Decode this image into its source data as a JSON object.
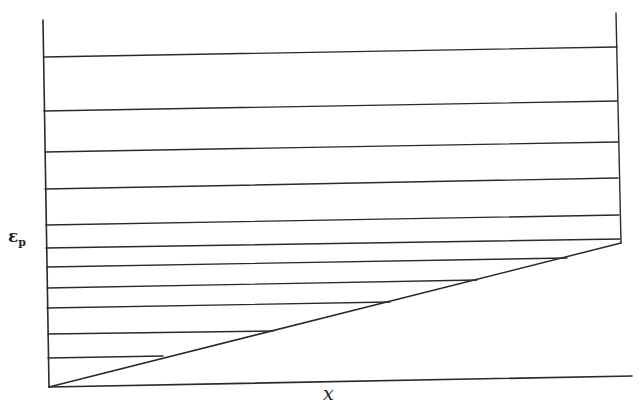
{
  "diagram": {
    "type": "line-diagram",
    "y_axis_label": "ε",
    "y_axis_label_subscript": "p",
    "x_axis_label": "x",
    "stroke_color": "#2a2a2a",
    "background": "#ffffff",
    "axes": {
      "left_axis": {
        "x1": 43,
        "y1": 20,
        "x2": 49,
        "y2": 387
      },
      "bottom_axis": {
        "x1": 49,
        "y1": 387,
        "x2": 632,
        "y2": 376
      },
      "right_boundary": {
        "x1": 616,
        "y1": 13,
        "x2": 621,
        "y2": 243
      },
      "diagonal": {
        "x1": 49,
        "y1": 387,
        "x2": 621,
        "y2": 243
      }
    },
    "horizontal_lines": [
      {
        "x1": 44,
        "y1": 57,
        "x2": 617,
        "y2": 47
      },
      {
        "x1": 44,
        "y1": 111,
        "x2": 617,
        "y2": 101
      },
      {
        "x1": 45,
        "y1": 152,
        "x2": 618,
        "y2": 142
      },
      {
        "x1": 45,
        "y1": 189,
        "x2": 618,
        "y2": 178
      },
      {
        "x1": 46,
        "y1": 225,
        "x2": 619,
        "y2": 215
      },
      {
        "x1": 46,
        "y1": 248,
        "x2": 620,
        "y2": 239
      },
      {
        "x1": 47,
        "y1": 267,
        "x2": 567,
        "y2": 258
      },
      {
        "x1": 47,
        "y1": 288,
        "x2": 477,
        "y2": 280
      },
      {
        "x1": 47,
        "y1": 308,
        "x2": 390,
        "y2": 302
      },
      {
        "x1": 48,
        "y1": 334,
        "x2": 273,
        "y2": 331
      },
      {
        "x1": 48,
        "y1": 358,
        "x2": 163,
        "y2": 356
      }
    ]
  }
}
